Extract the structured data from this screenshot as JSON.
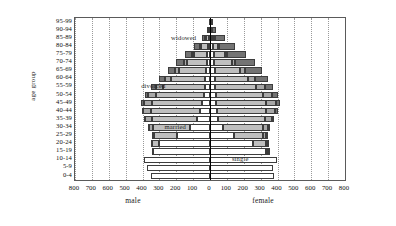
{
  "chart_data": {
    "type": "bar",
    "subtype": "population-pyramid-stacked",
    "title": "",
    "xlabel_left": "male",
    "xlabel_right": "female",
    "ylabel": "age group",
    "grid": true,
    "legend_position": "inline-annotations",
    "xlim": [
      -800,
      800
    ],
    "xticks_left": [
      "800",
      "700",
      "600",
      "500",
      "400",
      "300",
      "200",
      "100",
      "0"
    ],
    "xticks_right": [
      "0",
      "100",
      "200",
      "300",
      "400",
      "500",
      "600",
      "700",
      "800"
    ],
    "xtick_values": [
      -800,
      -700,
      -600,
      -500,
      -400,
      -300,
      -200,
      -100,
      0,
      100,
      200,
      300,
      400,
      500,
      600,
      700,
      800
    ],
    "categories": [
      "95-99",
      "90-94",
      "85-89",
      "80-84",
      "75-79",
      "70-74",
      "65-69",
      "60-64",
      "55-59",
      "50-54",
      "45-49",
      "40-44",
      "35-39",
      "30-34",
      "25-29",
      "20-24",
      "15-19",
      "10-14",
      "5-9",
      "0-4"
    ],
    "status_order": [
      "single",
      "married",
      "divorced",
      "widowed"
    ],
    "colors": {
      "single": "#ffffff",
      "married": "#bfbfbf",
      "divorced": "#a8a8a8",
      "widowed": "#737373",
      "outline": "#3d3d3d",
      "frame": "#5a5a5a",
      "grid": "#9a9a9a",
      "zero_axis": "#000000"
    },
    "annotations": [
      {
        "text": "widowed",
        "category": "85-89",
        "side": "male",
        "value": 150
      },
      {
        "text": "divorced",
        "category": "55-59",
        "side": "male",
        "value": 330
      },
      {
        "text": "married",
        "category": "30-34",
        "side": "male",
        "value": 200
      },
      {
        "text": "single",
        "category": "10-14",
        "side": "female",
        "value": 185
      }
    ],
    "series_male": [
      {
        "category": "95-99",
        "single": 2,
        "married": 1,
        "divorced": 0,
        "widowed": 2
      },
      {
        "category": "90-94",
        "single": 4,
        "married": 5,
        "divorced": 1,
        "widowed": 9
      },
      {
        "category": "85-89",
        "single": 8,
        "married": 17,
        "divorced": 3,
        "widowed": 22
      },
      {
        "category": "80-84",
        "single": 12,
        "married": 42,
        "divorced": 6,
        "widowed": 35
      },
      {
        "category": "75-79",
        "single": 16,
        "married": 78,
        "divorced": 11,
        "widowed": 45
      },
      {
        "category": "70-74",
        "single": 20,
        "married": 118,
        "divorced": 18,
        "widowed": 44
      },
      {
        "category": "65-69",
        "single": 24,
        "married": 160,
        "divorced": 26,
        "widowed": 40
      },
      {
        "category": "60-64",
        "single": 28,
        "married": 205,
        "divorced": 34,
        "widowed": 33
      },
      {
        "category": "55-59",
        "single": 32,
        "married": 248,
        "divorced": 42,
        "widowed": 26
      },
      {
        "category": "50-54",
        "single": 38,
        "married": 282,
        "divorced": 48,
        "widowed": 18
      },
      {
        "category": "45-49",
        "single": 46,
        "married": 298,
        "divorced": 50,
        "widowed": 12
      },
      {
        "category": "40-44",
        "single": 58,
        "married": 292,
        "divorced": 46,
        "widowed": 8
      },
      {
        "category": "35-39",
        "single": 78,
        "married": 268,
        "divorced": 38,
        "widowed": 5
      },
      {
        "category": "30-34",
        "single": 118,
        "married": 222,
        "divorced": 26,
        "widowed": 3
      },
      {
        "category": "25-29",
        "single": 196,
        "married": 134,
        "divorced": 12,
        "widowed": 1
      },
      {
        "category": "20-24",
        "single": 300,
        "married": 44,
        "divorced": 3,
        "widowed": 0
      },
      {
        "category": "15-19",
        "single": 340,
        "married": 4,
        "divorced": 0,
        "widowed": 0
      },
      {
        "category": "10-14",
        "single": 392,
        "married": 0,
        "divorced": 0,
        "widowed": 0
      },
      {
        "category": "5-9",
        "single": 372,
        "married": 0,
        "divorced": 0,
        "widowed": 0
      },
      {
        "category": "0-4",
        "single": 352,
        "married": 0,
        "divorced": 0,
        "widowed": 0
      }
    ],
    "series_female": [
      {
        "category": "95-99",
        "single": 3,
        "married": 1,
        "divorced": 0,
        "widowed": 7
      },
      {
        "category": "90-94",
        "single": 7,
        "married": 3,
        "divorced": 1,
        "widowed": 26
      },
      {
        "category": "85-89",
        "single": 14,
        "married": 11,
        "divorced": 3,
        "widowed": 62
      },
      {
        "category": "80-84",
        "single": 20,
        "married": 28,
        "divorced": 6,
        "widowed": 96
      },
      {
        "category": "75-79",
        "single": 24,
        "married": 62,
        "divorced": 12,
        "widowed": 118
      },
      {
        "category": "70-74",
        "single": 26,
        "married": 104,
        "divorced": 20,
        "widowed": 116
      },
      {
        "category": "65-69",
        "single": 28,
        "married": 152,
        "divorced": 30,
        "widowed": 98
      },
      {
        "category": "60-64",
        "single": 30,
        "married": 198,
        "divorced": 40,
        "widowed": 76
      },
      {
        "category": "55-59",
        "single": 32,
        "married": 242,
        "divorced": 50,
        "widowed": 52
      },
      {
        "category": "50-54",
        "single": 34,
        "married": 278,
        "divorced": 56,
        "widowed": 34
      },
      {
        "category": "45-49",
        "single": 36,
        "married": 296,
        "divorced": 58,
        "widowed": 22
      },
      {
        "category": "40-44",
        "single": 40,
        "married": 294,
        "divorced": 54,
        "widowed": 14
      },
      {
        "category": "35-39",
        "single": 50,
        "married": 276,
        "divorced": 44,
        "widowed": 9
      },
      {
        "category": "30-34",
        "single": 76,
        "married": 238,
        "divorced": 30,
        "widowed": 5
      },
      {
        "category": "25-29",
        "single": 142,
        "married": 172,
        "divorced": 15,
        "widowed": 2
      },
      {
        "category": "20-24",
        "single": 252,
        "married": 78,
        "divorced": 5,
        "widowed": 1
      },
      {
        "category": "15-19",
        "single": 330,
        "married": 12,
        "divorced": 1,
        "widowed": 0
      },
      {
        "category": "10-14",
        "single": 398,
        "married": 0,
        "divorced": 0,
        "widowed": 0
      },
      {
        "category": "5-9",
        "single": 374,
        "married": 0,
        "divorced": 0,
        "widowed": 0
      },
      {
        "category": "0-4",
        "single": 378,
        "married": 0,
        "divorced": 0,
        "widowed": 0
      }
    ]
  }
}
